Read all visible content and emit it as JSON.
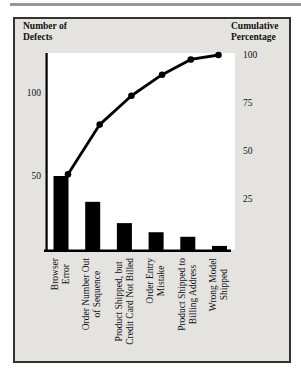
{
  "page": {
    "background_color": "#ffffff",
    "top_rule_color": "#979797"
  },
  "chart_box": {
    "background_color": "#e4e3e0",
    "border_color": "#333333"
  },
  "chart_data": {
    "type": "pareto (bar + cumulative line)",
    "title_left": "Number of\nDefects",
    "title_right": "Cumulative\nPercentage",
    "categories": [
      [
        "Browser",
        "Error"
      ],
      [
        "Order Number Out",
        "of Sequence"
      ],
      [
        "Product Shipped, but",
        "Credit Card Not Billed"
      ],
      [
        "Order Entry",
        "Mistake"
      ],
      [
        "Product Shipped to",
        "Billing Address"
      ],
      [
        "Wrong Model",
        "Shipped"
      ]
    ],
    "series": [
      {
        "name": "Number of Defects",
        "type": "bar",
        "color": "#000000",
        "values": [
          50,
          33,
          19,
          13,
          10,
          4
        ]
      },
      {
        "name": "Cumulative Percentage",
        "type": "line",
        "color": "#000000",
        "values": [
          38.8,
          64.3,
          79.1,
          89.9,
          97.7,
          100
        ]
      }
    ],
    "left_axis": {
      "label": "Number of Defects",
      "ticks": [
        100,
        50
      ],
      "range": [
        0,
        130
      ]
    },
    "right_axis": {
      "label": "Cumulative Percentage",
      "ticks": [
        100,
        75,
        50,
        25
      ],
      "range": [
        0,
        100
      ]
    },
    "grid": false,
    "legend": false
  }
}
